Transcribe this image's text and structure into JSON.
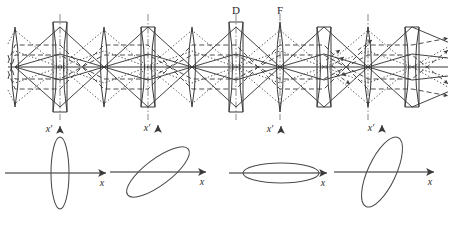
{
  "figure": {
    "colors": {
      "stroke": "#3a3a3a",
      "axis": "#6b6b6b",
      "background": "#ffffff",
      "ellipse": "#4a4a4a"
    }
  },
  "beamline": {
    "axis_label": "optical-axis",
    "axis_y": 67,
    "lens_spacing": 44,
    "lenses": [
      {
        "index": 0,
        "x": 15,
        "type": "converging",
        "symbol": "biconvex",
        "top": 27,
        "bottom": 107,
        "dashdot": false
      },
      {
        "index": 1,
        "x": 60,
        "type": "diverging",
        "symbol": "biconcave",
        "top": 22,
        "bottom": 112,
        "dashdot": true
      },
      {
        "index": 2,
        "x": 104,
        "type": "converging",
        "symbol": "biconvex",
        "top": 27,
        "bottom": 107,
        "dashdot": false
      },
      {
        "index": 3,
        "x": 148,
        "type": "diverging",
        "symbol": "biconcave",
        "top": 27,
        "bottom": 107,
        "dashdot": true
      },
      {
        "index": 4,
        "x": 192,
        "type": "converging",
        "symbol": "biconvex",
        "top": 27,
        "bottom": 107,
        "dashdot": false
      },
      {
        "index": 5,
        "x": 236,
        "type": "diverging",
        "symbol": "biconcave",
        "top": 22,
        "bottom": 112,
        "dashdot": true
      },
      {
        "index": 6,
        "x": 280,
        "type": "converging",
        "symbol": "biconvex",
        "top": 22,
        "bottom": 112,
        "dashdot": true
      },
      {
        "index": 7,
        "x": 324,
        "type": "diverging",
        "symbol": "biconcave",
        "top": 27,
        "bottom": 107,
        "dashdot": false
      },
      {
        "index": 8,
        "x": 368,
        "type": "converging",
        "symbol": "biconvex",
        "top": 27,
        "bottom": 107,
        "dashdot": true
      },
      {
        "index": 9,
        "x": 412,
        "type": "diverging",
        "symbol": "biconcave",
        "top": 27,
        "bottom": 107,
        "dashdot": false
      }
    ],
    "labels": [
      {
        "id": "label-D",
        "text": "D",
        "x": 236,
        "y": 14,
        "meaning": "defocusing-lens"
      },
      {
        "id": "label-F",
        "text": "F",
        "x": 280,
        "y": 14,
        "meaning": "focusing-lens"
      }
    ],
    "ray_families": [
      {
        "id": "ray-solid",
        "style": "solid",
        "description": "on-momentum principal ray bundle"
      },
      {
        "id": "ray-dotted",
        "style": "dotted",
        "description": "second ray bundle"
      },
      {
        "id": "ray-dashed",
        "style": "dashed",
        "description": "third ray bundle, exits with arrowheads"
      }
    ],
    "arrow_count": 5,
    "envelope_half_height": 40
  },
  "phase_plots": {
    "x_axis_label": "x",
    "y_axis_label": "x′",
    "plots": [
      {
        "id": "phase-plot-1",
        "name": "upright-tall-ellipse",
        "center": {
          "x": 60,
          "y": 173
        },
        "ellipse": {
          "rx": 9,
          "ry": 36,
          "angle": 0
        },
        "caption": "waist in x′ — large divergence, small size",
        "axis": {
          "x_from": -55,
          "x_to": 46,
          "y_from": -45,
          "y_to": 47
        }
      },
      {
        "id": "phase-plot-2",
        "name": "tilted-positive-ellipse",
        "center": {
          "x": 158,
          "y": 172
        },
        "ellipse": {
          "rx": 38,
          "ry": 13,
          "angle": -37
        },
        "caption": "diverging beam — positive x–x′ correlation",
        "axis": {
          "x_from": -48,
          "x_to": 48,
          "y_from": -45,
          "y_to": 47
        }
      },
      {
        "id": "phase-plot-3",
        "name": "flat-wide-ellipse",
        "center": {
          "x": 281,
          "y": 173
        },
        "ellipse": {
          "rx": 38,
          "ry": 10,
          "angle": 0
        },
        "caption": "waist in x — large size, small divergence",
        "axis": {
          "x_from": -52,
          "x_to": 46,
          "y_from": -45,
          "y_to": 47
        }
      },
      {
        "id": "phase-plot-4",
        "name": "tilted-negative-ellipse",
        "center": {
          "x": 382,
          "y": 172
        },
        "ellipse": {
          "rx": 38,
          "ry": 14,
          "angle": -65
        },
        "caption": "converging beam — negative x–x′ correlation",
        "axis": {
          "x_from": -48,
          "x_to": 52,
          "y_from": -45,
          "y_to": 47
        }
      }
    ]
  }
}
